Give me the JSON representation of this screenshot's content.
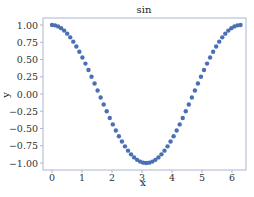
{
  "chart_data": {
    "type": "scatter",
    "title": "sin",
    "xlabel": "x",
    "ylabel": "y",
    "xlim": [
      -0.3,
      6.6
    ],
    "ylim": [
      -1.1,
      1.1
    ],
    "xticks": [
      0,
      1,
      2,
      3,
      4,
      5,
      6
    ],
    "xtick_labels": [
      "0",
      "1",
      "2",
      "3",
      "4",
      "5",
      "6"
    ],
    "yticks": [
      1.0,
      0.75,
      0.5,
      0.25,
      0.0,
      -0.25,
      -0.5,
      -0.75,
      -1.0
    ],
    "ytick_labels": [
      "1.00",
      "0.75",
      "0.50",
      "0.25",
      "0.00",
      "−0.25",
      "−0.50",
      "−0.75",
      "−1.00"
    ],
    "grid": false,
    "legend": null,
    "series": [
      {
        "name": "sin",
        "function": "cos(x)",
        "x_start": 0,
        "x_end": 6.2832,
        "num_points": 63,
        "marker_color": "#4a6fb5",
        "marker_size": 2.2
      }
    ],
    "frame_color": "#aab6cf"
  }
}
